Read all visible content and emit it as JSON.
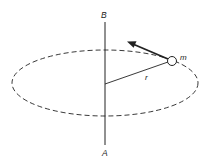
{
  "diagram": {
    "labels": {
      "top_axis": "B",
      "bottom_axis": "A",
      "mass": "m",
      "radius": "r"
    },
    "colors": {
      "stroke": "#222222",
      "background": "#ffffff"
    },
    "geometry": {
      "axis": {
        "x": 105,
        "y_top": 22,
        "y_bottom": 145
      },
      "orbit": {
        "cx": 105,
        "cy": 83,
        "rx": 93,
        "ry": 33,
        "style": "dashed"
      },
      "radius_line": {
        "x1": 105,
        "y1": 84,
        "x2": 168,
        "y2": 62
      },
      "mass_circle": {
        "cx": 172,
        "cy": 61,
        "r": 4.5
      },
      "velocity_arrow": {
        "x1": 168,
        "y1": 59,
        "x2": 128,
        "y2": 42
      }
    }
  }
}
